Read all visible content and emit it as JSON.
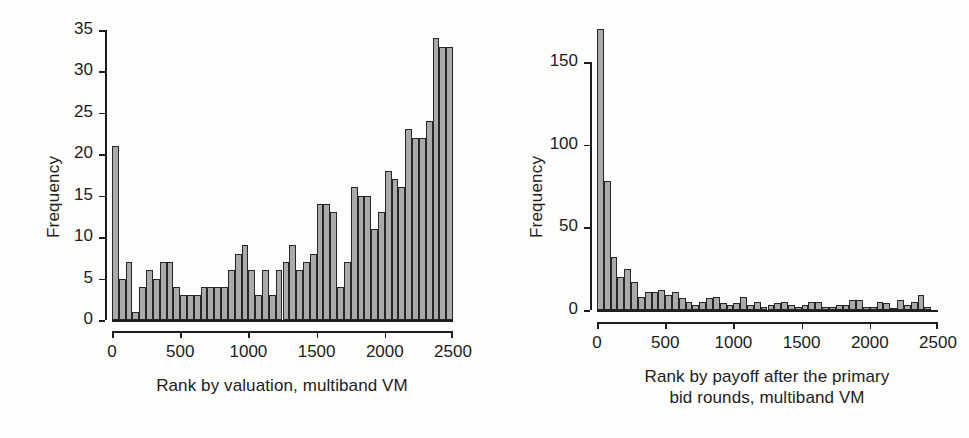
{
  "figure": {
    "background": "#fdfdfc",
    "bar_fill": "#aaaaaa",
    "bar_edge": "#262626",
    "axis_color": "#1d1d1d"
  },
  "chart_data": [
    {
      "type": "bar",
      "id": "left",
      "title": "",
      "xlabel": "Rank by valuation, multiband VM",
      "ylabel": "Frequency",
      "xlim": [
        0,
        2500
      ],
      "ylim": [
        0,
        35
      ],
      "xticks": [
        0,
        500,
        1000,
        1500,
        2000,
        2500
      ],
      "xtick_labels": [
        "0",
        "500",
        "1000",
        "1500",
        "2000",
        "2500"
      ],
      "yticks": [
        0,
        5,
        10,
        15,
        20,
        25,
        30,
        35
      ],
      "ytick_labels": [
        "0",
        "5",
        "10",
        "15",
        "20",
        "25",
        "30",
        "35"
      ],
      "grid": false,
      "legend": "none",
      "bin_width": 50,
      "bin_starts": [
        0,
        50,
        100,
        150,
        200,
        250,
        300,
        350,
        400,
        450,
        500,
        550,
        600,
        650,
        700,
        750,
        800,
        850,
        900,
        950,
        1000,
        1050,
        1100,
        1150,
        1200,
        1250,
        1300,
        1350,
        1400,
        1450,
        1500,
        1550,
        1600,
        1650,
        1700,
        1750,
        1800,
        1850,
        1900,
        1950,
        2000,
        2050,
        2100,
        2150,
        2200,
        2250,
        2300,
        2350
      ],
      "values": [
        21,
        5,
        7,
        1,
        4,
        6,
        5,
        7,
        7,
        4,
        3,
        3,
        3,
        4,
        4,
        4,
        4,
        6,
        8,
        9,
        6,
        3,
        6,
        3,
        6,
        7,
        9,
        6,
        7,
        8,
        14,
        14,
        13,
        4,
        7,
        16,
        15,
        15,
        11,
        13,
        18,
        17,
        16,
        23,
        22,
        22,
        24,
        34,
        33,
        33
      ]
    },
    {
      "type": "bar",
      "id": "right",
      "title": "",
      "xlabel": "Rank by payoff after the primary\nbid rounds, multiband VM",
      "ylabel": "Frequency",
      "xlim": [
        0,
        2500
      ],
      "ylim": [
        0,
        170
      ],
      "xticks": [
        0,
        500,
        1000,
        1500,
        2000,
        2500
      ],
      "xtick_labels": [
        "0",
        "500",
        "1000",
        "1500",
        "2000",
        "2500"
      ],
      "yticks": [
        0,
        50,
        100,
        150
      ],
      "ytick_labels": [
        "0",
        "50",
        "100",
        "150"
      ],
      "grid": false,
      "legend": "none",
      "bin_width": 50,
      "bin_starts": [
        0,
        50,
        100,
        150,
        200,
        250,
        300,
        350,
        400,
        450,
        500,
        550,
        600,
        650,
        700,
        750,
        800,
        850,
        900,
        950,
        1000,
        1050,
        1100,
        1150,
        1200,
        1250,
        1300,
        1350,
        1400,
        1450,
        1500,
        1550,
        1600,
        1650,
        1700,
        1750,
        1800,
        1850,
        1900,
        1950,
        2000,
        2050,
        2100,
        2150,
        2200,
        2250,
        2300,
        2350
      ],
      "values": [
        170,
        78,
        32,
        20,
        25,
        17,
        8,
        11,
        11,
        12,
        9,
        11,
        7,
        5,
        3,
        5,
        7,
        8,
        4,
        3,
        4,
        8,
        3,
        5,
        2,
        3,
        4,
        5,
        3,
        2,
        3,
        5,
        5,
        2,
        2,
        3,
        3,
        6,
        6,
        2,
        2,
        5,
        4,
        1,
        6,
        3,
        5,
        9,
        2
      ]
    }
  ]
}
